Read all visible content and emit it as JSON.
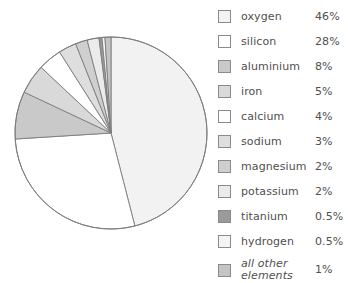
{
  "chart_data": {
    "type": "pie",
    "title": "",
    "subtitle": "",
    "xlabel": "",
    "ylabel": "",
    "legend_position": "right",
    "grid": false,
    "units": "percent",
    "start_angle_deg": 0,
    "direction": "clockwise",
    "total": 100,
    "categories": [
      "oxygen",
      "silicon",
      "aluminium",
      "iron",
      "calcium",
      "sodium",
      "magnesium",
      "potassium",
      "titanium",
      "hydrogen",
      "all other elements"
    ],
    "values": [
      46,
      28,
      8,
      5,
      4,
      3,
      2,
      2,
      0.5,
      0.5,
      1
    ],
    "value_labels": [
      "46%",
      "28%",
      "8%",
      "5%",
      "4%",
      "3%",
      "2%",
      "2%",
      "0.5%",
      "0.5%",
      "1%"
    ],
    "slice_colors": [
      "#f2f2f2",
      "#ffffff",
      "#c9c9c9",
      "#d9d9d9",
      "#ffffff",
      "#dedede",
      "#cfcfcf",
      "#ebebeb",
      "#9a9a9a",
      "#f4f4f4",
      "#c4c4c4"
    ],
    "slice_stroke": "#7d7d7d"
  },
  "legend": {
    "items": [
      {
        "label": "oxygen",
        "value": "46%",
        "color": "#f2f2f2",
        "italic": false
      },
      {
        "label": "silicon",
        "value": "28%",
        "color": "#ffffff",
        "italic": false
      },
      {
        "label": "aluminium",
        "value": "8%",
        "color": "#c9c9c9",
        "italic": false
      },
      {
        "label": "iron",
        "value": "5%",
        "color": "#d9d9d9",
        "italic": false
      },
      {
        "label": "calcium",
        "value": "4%",
        "color": "#ffffff",
        "italic": false
      },
      {
        "label": "sodium",
        "value": "3%",
        "color": "#dedede",
        "italic": false
      },
      {
        "label": "magnesium",
        "value": "2%",
        "color": "#cfcfcf",
        "italic": false
      },
      {
        "label": "potassium",
        "value": "2%",
        "color": "#ebebeb",
        "italic": false
      },
      {
        "label": "titanium",
        "value": "0.5%",
        "color": "#9a9a9a",
        "italic": false
      },
      {
        "label": "hydrogen",
        "value": "0.5%",
        "color": "#f4f4f4",
        "italic": false
      },
      {
        "label": "all other\nelements",
        "value": "1%",
        "color": "#c4c4c4",
        "italic": true
      }
    ]
  },
  "geometry": {
    "center_x": 111,
    "center_y": 133,
    "radius": 96
  }
}
